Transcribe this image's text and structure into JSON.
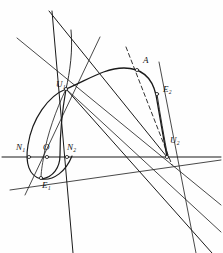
{
  "figure": {
    "kind": "geometric-construction-diagram",
    "width": 223,
    "height": 253,
    "background_color": "#fefefe",
    "ink_color": "#1a1a1a",
    "labels": [
      {
        "id": "U1",
        "base": "U",
        "sub": "1",
        "text": "U₁",
        "x": 56,
        "y": 84
      },
      {
        "id": "U2",
        "base": "U",
        "sub": "2",
        "text": "U₂",
        "x": 170,
        "y": 140
      },
      {
        "id": "E1",
        "base": "E",
        "sub": "1",
        "text": "E₁",
        "x": 42,
        "y": 184
      },
      {
        "id": "E2",
        "base": "E",
        "sub": "2",
        "text": "E₂",
        "x": 163,
        "y": 89
      },
      {
        "id": "N1",
        "base": "N",
        "sub": "1",
        "text": "N₁",
        "x": 18,
        "y": 147
      },
      {
        "id": "N2",
        "base": "N",
        "sub": "2",
        "text": "N₂",
        "x": 68,
        "y": 147
      },
      {
        "id": "O",
        "base": "O",
        "sub": "",
        "text": "O",
        "x": 44,
        "y": 146
      },
      {
        "id": "A",
        "base": "A",
        "sub": "",
        "text": "A",
        "x": 143,
        "y": 60
      }
    ],
    "nodes": [
      {
        "id": "U1",
        "x": 66,
        "y": 89,
        "marked": true
      },
      {
        "id": "U2",
        "x": 167,
        "y": 157,
        "marked": true
      },
      {
        "id": "E1",
        "x": 41,
        "y": 178,
        "marked": true
      },
      {
        "id": "E2",
        "x": 157,
        "y": 94,
        "marked": true
      },
      {
        "id": "N1",
        "x": 29,
        "y": 157,
        "marked": true
      },
      {
        "id": "O",
        "x": 47,
        "y": 157,
        "marked": true
      },
      {
        "id": "N2",
        "x": 67,
        "y": 157,
        "marked": true
      },
      {
        "id": "A",
        "x": 137,
        "y": 70,
        "marked": true
      }
    ],
    "axis": {
      "id": "horizontal-axis",
      "x1": 2,
      "y1": 157,
      "x2": 221,
      "y2": 157
    },
    "straight_lines": [
      {
        "id": "line-top-steep-a",
        "x1": 52,
        "y1": 11,
        "x2": 73,
        "y2": 253,
        "dashed": false
      },
      {
        "id": "line-top-steep-b",
        "x1": 49,
        "y1": 11,
        "x2": 167,
        "y2": 157,
        "dashed": false
      },
      {
        "id": "line-u1-upper-right",
        "x1": 100,
        "y1": 37,
        "x2": 25,
        "y2": 195,
        "dashed": false
      },
      {
        "id": "line-upperleft-to-u2",
        "x1": 17,
        "y1": 38,
        "x2": 221,
        "y2": 205,
        "dashed": false
      },
      {
        "id": "line-u1-to-lower-right",
        "x1": 66,
        "y1": 89,
        "x2": 221,
        "y2": 232,
        "dashed": false
      },
      {
        "id": "line-u2-steep-upper",
        "x1": 159,
        "y1": 62,
        "x2": 196,
        "y2": 253,
        "dashed": false
      },
      {
        "id": "line-e1-to-u2-chord",
        "x1": 10,
        "y1": 190,
        "x2": 221,
        "y2": 160,
        "dashed": false
      },
      {
        "id": "line-u1-through-u2-right",
        "x1": 66,
        "y1": 89,
        "x2": 212,
        "y2": 253,
        "dashed": false
      },
      {
        "id": "line-dashed-through-a",
        "x1": 126,
        "y1": 47,
        "x2": 172,
        "y2": 165,
        "dashed": true
      }
    ],
    "curves": [
      {
        "id": "arc-main-right",
        "description": "large arc from U1 over A and E2 down to U2"
      },
      {
        "id": "loop-left-outer",
        "description": "left loop from U1 through N1 and E1 back up"
      },
      {
        "id": "loop-left-inner",
        "description": "inner loop branch from U1 through N2 to E1"
      }
    ]
  }
}
